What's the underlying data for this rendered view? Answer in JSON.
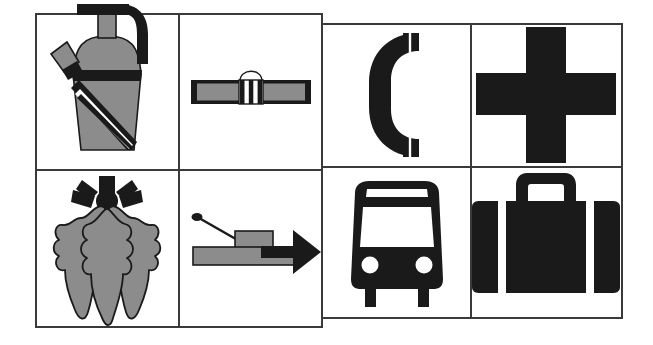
{
  "sheet": {
    "title": "Safety and travel pictogram sheet",
    "background_color": "#ffffff",
    "stroke_color": "#3a3a3a",
    "ink_black": "#1a1a1a",
    "ink_gray": "#8c8c8c",
    "panel_fill": "#ffffff",
    "border_width": 2,
    "divider_width": 2
  },
  "groups": [
    {
      "id": "left-group",
      "name": "left-pictogram-group",
      "x": 36,
      "y": 14,
      "width": 286,
      "height": 313,
      "columns": 2,
      "rows": 2,
      "divider_x": 179,
      "divider_y": 170
    },
    {
      "id": "right-group",
      "name": "right-pictogram-group",
      "x": 322,
      "y": 24,
      "width": 300,
      "height": 294,
      "columns": 2,
      "rows": 2,
      "divider_x": 471,
      "divider_y": 167
    }
  ],
  "cells": [
    {
      "id": "cell-fire-extinguisher",
      "group": "left-group",
      "row": 1,
      "column": 1,
      "icon_name": "fire-extinguisher-icon",
      "label": "Fire extinguisher",
      "fill": "gray-and-black",
      "cx": 107,
      "cy": 92
    },
    {
      "id": "cell-seat-belt",
      "group": "left-group",
      "row": 1,
      "column": 2,
      "icon_name": "seat-belt-icon",
      "label": "Seat belt",
      "fill": "gray-and-black",
      "cx": 251,
      "cy": 92
    },
    {
      "id": "cell-telephone",
      "group": "right-group",
      "row": 1,
      "column": 1,
      "icon_name": "telephone-handset-icon",
      "label": "Telephone",
      "fill": "black",
      "cx": 397,
      "cy": 95
    },
    {
      "id": "cell-first-aid-cross",
      "group": "right-group",
      "row": 1,
      "column": 2,
      "icon_name": "first-aid-cross-icon",
      "label": "First aid",
      "fill": "black",
      "cx": 546,
      "cy": 95
    },
    {
      "id": "cell-oak-leaves",
      "group": "left-group",
      "row": 2,
      "column": 1,
      "icon_name": "oak-leaves-icon",
      "label": "Oak leaves cluster",
      "fill": "gray-and-black",
      "cx": 107,
      "cy": 248
    },
    {
      "id": "cell-fire-hose-arrow",
      "group": "left-group",
      "row": 2,
      "column": 2,
      "icon_name": "hose-arrow-icon",
      "label": "Directional hose arrow",
      "fill": "gray-and-black",
      "cx": 251,
      "cy": 248
    },
    {
      "id": "cell-bus",
      "group": "right-group",
      "row": 2,
      "column": 1,
      "icon_name": "bus-icon",
      "label": "Bus",
      "fill": "black",
      "cx": 397,
      "cy": 243
    },
    {
      "id": "cell-suitcase",
      "group": "right-group",
      "row": 2,
      "column": 2,
      "icon_name": "suitcase-icon",
      "label": "Baggage",
      "fill": "black",
      "cx": 546,
      "cy": 243
    }
  ]
}
